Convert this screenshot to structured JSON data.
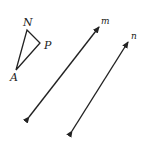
{
  "diagram": {
    "type": "geometry",
    "triangle": {
      "vertices": [
        {
          "label": "N",
          "x": 27,
          "y": 30
        },
        {
          "label": "P",
          "x": 40,
          "y": 43
        },
        {
          "label": "A",
          "x": 16,
          "y": 70
        }
      ]
    },
    "lines": [
      {
        "label": "m",
        "x1": 29,
        "y1": 117,
        "x2": 99,
        "y2": 27,
        "arrows": "both"
      },
      {
        "label": "n",
        "x1": 72,
        "y1": 131,
        "x2": 128,
        "y2": 42,
        "arrows": "both"
      }
    ],
    "stroke_color": "#222222"
  },
  "labels": {
    "N": "N",
    "P": "P",
    "A": "A",
    "m": "m",
    "n": "n"
  }
}
